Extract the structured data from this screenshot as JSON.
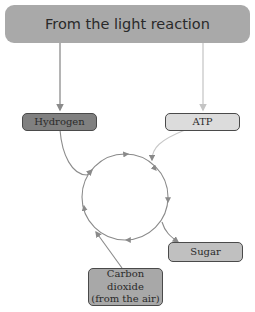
{
  "diagram": {
    "title": "From the light reaction",
    "nodes": {
      "hydrogen": {
        "label": "Hydrogen",
        "fill": "#808080"
      },
      "atp": {
        "label": "ATP",
        "fill": "#dcdcdc"
      },
      "sugar": {
        "label": "Sugar",
        "fill": "#c0c0c0"
      },
      "carbon_dioxide": {
        "line1": "Carbon dioxide",
        "line2": "(from the air)",
        "fill": "#a8a8a8"
      }
    },
    "colors": {
      "banner": "#a9a9a9",
      "hydrogen_arrow": "#8c8c8c",
      "atp_arrow": "#c8c8c8",
      "cycle": "#8a8a8a"
    }
  }
}
